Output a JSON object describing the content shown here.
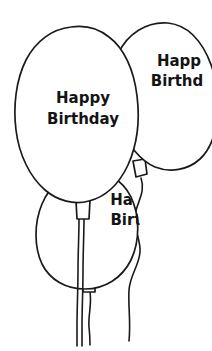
{
  "scene": {
    "title": "Happy Birthday Balloons",
    "width": 212,
    "height": 351,
    "background_color": "#ffffff",
    "ink_color": "#1a1a1a",
    "style": "black-and-white line drawing / coloring-book clipart"
  },
  "balloons": [
    {
      "id": "balloon-main-left",
      "position": "center-left, front-most large balloon",
      "text_lines": [
        "Happy",
        "Birthday"
      ],
      "line1": "Happy",
      "line2": "Birthday",
      "text_clipped": false,
      "fill_color": "#ffffff",
      "outline_color": "#1a1a1a",
      "knot": true,
      "string": true
    },
    {
      "id": "balloon-right-upper",
      "position": "upper-right, partially off the right edge",
      "text_lines": [
        "Happ",
        "Birthd"
      ],
      "line1": "Happ",
      "line2": "Birthd",
      "text_clipped": true,
      "fill_color": "#ffffff",
      "outline_color": "#1a1a1a",
      "knot": true,
      "string": true
    },
    {
      "id": "balloon-front-lower",
      "position": "lower-center, behind main balloon",
      "text_lines": [
        "Hap",
        "Birt"
      ],
      "line1": "Hap",
      "line2": "Birt",
      "text_clipped": true,
      "fill_color": "#ffffff",
      "outline_color": "#1a1a1a",
      "knot": true,
      "string": true
    }
  ]
}
